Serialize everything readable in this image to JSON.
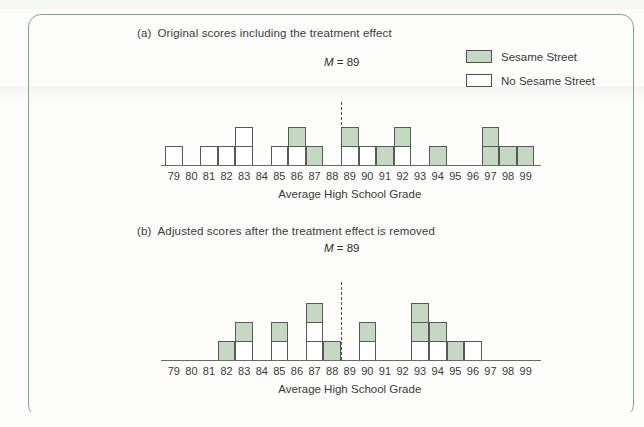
{
  "figure": {
    "frame_color": "#7fa882",
    "bar_green": "#c5d9c2",
    "bar_white": "#ffffff",
    "outline_color": "#585858"
  },
  "legend": {
    "items": [
      {
        "label": "Sesame Street",
        "fill": "green",
        "swatch_name": "legend-swatch-sesame-street"
      },
      {
        "label": "No Sesame Street",
        "fill": "white",
        "swatch_name": "legend-swatch-no-sesame-street"
      }
    ]
  },
  "panel_a": {
    "tag": "(a)",
    "caption": "Original scores including the treatment effect",
    "mean_label": "M = 89",
    "mean_value": 89,
    "axis_title": "Average High School Grade"
  },
  "panel_b": {
    "tag": "(b)",
    "caption": "Adjusted scores after the treatment effect is removed",
    "mean_label": "M = 89",
    "mean_value": 89,
    "axis_title": "Average High School Grade"
  },
  "chart_data": [
    {
      "type": "bar",
      "id": "panel-a-histogram",
      "title": "(a) Original scores including the treatment effect",
      "xlabel": "Average High School Grade",
      "ylabel": "Frequency",
      "categories": [
        79,
        80,
        81,
        82,
        83,
        84,
        85,
        86,
        87,
        88,
        89,
        90,
        91,
        92,
        93,
        94,
        95,
        96,
        97,
        98,
        99
      ],
      "series": [
        {
          "name": "No Sesame Street",
          "values": [
            1,
            0,
            1,
            1,
            2,
            0,
            1,
            1,
            0,
            0,
            1,
            1,
            0,
            1,
            0,
            0,
            0,
            0,
            0,
            0,
            0
          ]
        },
        {
          "name": "Sesame Street",
          "values": [
            0,
            0,
            0,
            0,
            0,
            0,
            0,
            1,
            1,
            0,
            1,
            0,
            1,
            1,
            0,
            1,
            0,
            0,
            2,
            1,
            1
          ]
        }
      ],
      "stacking": "stacked",
      "stack_order_bottom_to_top": [
        "No Sesame Street",
        "Sesame Street"
      ],
      "totals": [
        1,
        0,
        1,
        1,
        2,
        0,
        1,
        2,
        1,
        0,
        2,
        1,
        1,
        2,
        0,
        1,
        0,
        0,
        2,
        1,
        1
      ],
      "ylim": [
        0,
        3
      ],
      "annotations": [
        {
          "text": "M = 89",
          "x": 89,
          "type": "dashed-vertical-line"
        }
      ],
      "grid": false,
      "legend_position": "top-right"
    },
    {
      "type": "bar",
      "id": "panel-b-histogram",
      "title": "(b) Adjusted scores after the treatment effect is removed",
      "xlabel": "Average High School Grade",
      "ylabel": "Frequency",
      "categories": [
        79,
        80,
        81,
        82,
        83,
        84,
        85,
        86,
        87,
        88,
        89,
        90,
        91,
        92,
        93,
        94,
        95,
        96,
        97,
        98,
        99
      ],
      "series": [
        {
          "name": "No Sesame Street",
          "values": [
            0,
            0,
            0,
            0,
            1,
            0,
            1,
            0,
            2,
            0,
            0,
            1,
            0,
            0,
            1,
            1,
            0,
            1,
            0,
            0,
            0
          ]
        },
        {
          "name": "Sesame Street",
          "values": [
            0,
            0,
            0,
            1,
            1,
            0,
            1,
            0,
            1,
            1,
            0,
            1,
            0,
            0,
            2,
            1,
            1,
            0,
            0,
            0,
            0
          ]
        }
      ],
      "stacking": "stacked",
      "stack_order_bottom_to_top": [
        "No Sesame Street",
        "Sesame Street"
      ],
      "totals": [
        0,
        0,
        0,
        1,
        2,
        0,
        2,
        0,
        3,
        1,
        0,
        2,
        0,
        0,
        3,
        2,
        1,
        1,
        0,
        0,
        0
      ],
      "ylim": [
        0,
        3
      ],
      "annotations": [
        {
          "text": "M = 89",
          "x": 89,
          "type": "dashed-vertical-line"
        }
      ],
      "grid": false,
      "legend_position": "none"
    }
  ]
}
